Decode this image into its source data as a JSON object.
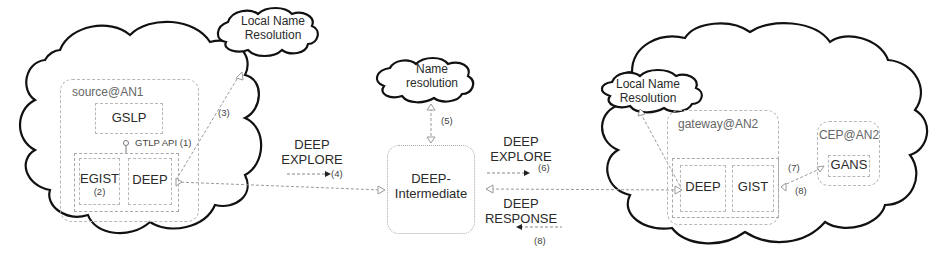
{
  "left_domain": {
    "host_label": "source@AN1",
    "gslp_label": "GSLP",
    "api_label": "GTLP API",
    "api_step": "(1)",
    "egist_label": "EGIST",
    "egist_step": "(2)",
    "deep_label": "DEEP",
    "local_resolution": {
      "line1": "Local Name",
      "line2": "Resolution"
    },
    "resolution_step": "(3)"
  },
  "left_message": {
    "line1": "DEEP",
    "line2": "EXPLORE",
    "step": "(4)"
  },
  "intermediate": {
    "line1": "DEEP-",
    "line2": "Intermediate",
    "name_resolution": {
      "line1": "Name",
      "line2": "resolution"
    },
    "resolution_step": "(5)"
  },
  "right_message_explore": {
    "line1": "DEEP",
    "line2": "EXPLORE",
    "step": "(6)"
  },
  "right_message_response": {
    "line1": "DEEP",
    "line2": "RESPONSE",
    "step": "(8)"
  },
  "right_domain": {
    "host_label": "gateway@AN2",
    "deep_label": "DEEP",
    "gist_label": "GIST",
    "local_resolution": {
      "line1": "Local Name",
      "line2": "Resolution"
    },
    "cep_label": "CEP@AN2",
    "gans_label": "GANS",
    "step_to_gans": "(7)",
    "step_from_gans": "(8)"
  },
  "colors": {
    "cloud_stroke": "#111111",
    "dashed_border": "#b8b8b8",
    "connector": "#999999",
    "text": "#2a2a2a"
  }
}
